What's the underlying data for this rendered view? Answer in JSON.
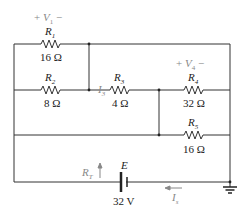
{
  "diagram": {
    "type": "circuit-schematic",
    "resistors": [
      {
        "name": "R1",
        "label": "R",
        "sub": "1",
        "value": "16 Ω"
      },
      {
        "name": "R2",
        "label": "R",
        "sub": "2",
        "value": "8 Ω"
      },
      {
        "name": "R3",
        "label": "R",
        "sub": "3",
        "value": "4 Ω"
      },
      {
        "name": "R4",
        "label": "R",
        "sub": "4",
        "value": "32 Ω"
      },
      {
        "name": "R5",
        "label": "R",
        "sub": "5",
        "value": "16 Ω"
      }
    ],
    "source": {
      "label": "E",
      "value": "32 V"
    },
    "annotations": {
      "v1": {
        "plus": "+",
        "v": "V",
        "sub": "1",
        "minus": "−"
      },
      "v4": {
        "plus": "+",
        "v": "V",
        "sub": "4",
        "minus": "−"
      },
      "i3": {
        "i": "I",
        "sub": "3"
      },
      "rt": {
        "r": "R",
        "sub": "T"
      },
      "is": {
        "i": "I",
        "sub": "s"
      }
    },
    "colors": {
      "wire": "#333333",
      "annotation": "#888888"
    }
  }
}
